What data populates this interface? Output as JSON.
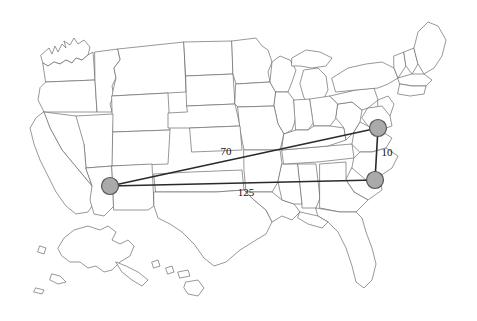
{
  "figure": {
    "type": "network-map",
    "basemap": "united-states",
    "background_color": "#ffffff",
    "border_color": "#6b6b6b",
    "edge_color": "#2a2a2a",
    "node_fill_color": "#aaaaaa",
    "node_stroke_color": "#555555"
  },
  "nodes": [
    {
      "id": "west",
      "label": "",
      "region": "Arizona",
      "x": 110,
      "y": 186,
      "r": 8.5
    },
    {
      "id": "northeast",
      "label": "",
      "region": "Maryland",
      "x": 378,
      "y": 128,
      "r": 8.5
    },
    {
      "id": "southeast",
      "label": "",
      "region": "North Carolina",
      "x": 375,
      "y": 180,
      "r": 8.5
    }
  ],
  "edges": [
    {
      "id": "west-northeast",
      "from": "west",
      "to": "northeast",
      "label": "70",
      "label_x": 226,
      "label_y": 152
    },
    {
      "id": "west-southeast",
      "from": "west",
      "to": "southeast",
      "label": "125",
      "label_x": 246,
      "label_y": 193
    },
    {
      "id": "northeast-southeast",
      "from": "northeast",
      "to": "southeast",
      "label": "10",
      "label_x": 387,
      "label_y": 153
    }
  ],
  "labels": {
    "edge_70": "70",
    "edge_125": "125",
    "edge_10": "10"
  }
}
